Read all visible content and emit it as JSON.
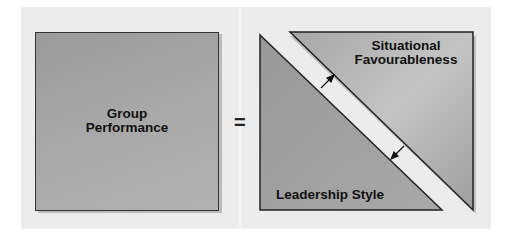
{
  "diagram": {
    "left_box": {
      "line1": "Group",
      "line2": "Performance"
    },
    "operator": "=",
    "upper_triangle": {
      "line1": "Situational",
      "line2": "Favourableness"
    },
    "lower_triangle": {
      "label": "Leadership Style"
    },
    "arrows": [
      "arrow-toward-situational-favourableness",
      "arrow-toward-leadership-style"
    ]
  },
  "colors": {
    "background_panel": "#ececec",
    "box_fill": "#a4a4a4",
    "divider_band": "#e8e8e8",
    "outline": "#222222"
  }
}
